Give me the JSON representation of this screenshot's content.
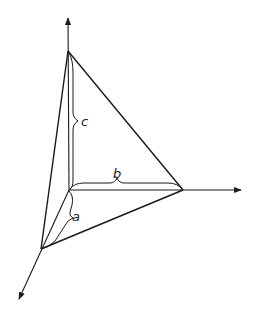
{
  "diagram": {
    "type": "tetrahedron-with-intercepts",
    "labels": {
      "a": "a",
      "b": "b",
      "c": "c"
    },
    "colors": {
      "line": "#1a1a1a",
      "background": "#ffffff"
    },
    "axes": [
      {
        "name": "z-axis",
        "direction": "up"
      },
      {
        "name": "y-axis",
        "direction": "right"
      },
      {
        "name": "x-axis",
        "direction": "down-left"
      }
    ]
  }
}
